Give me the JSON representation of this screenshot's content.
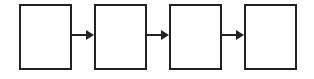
{
  "diagram": {
    "type": "flow",
    "nodes": [
      {
        "id": "box-1",
        "label": ""
      },
      {
        "id": "box-2",
        "label": ""
      },
      {
        "id": "box-3",
        "label": ""
      },
      {
        "id": "box-4",
        "label": ""
      }
    ],
    "edges": [
      {
        "from": "box-1",
        "to": "box-2"
      },
      {
        "from": "box-2",
        "to": "box-3"
      },
      {
        "from": "box-3",
        "to": "box-4"
      }
    ],
    "colors": {
      "stroke": "#222222",
      "fill": "#ffffff"
    }
  }
}
